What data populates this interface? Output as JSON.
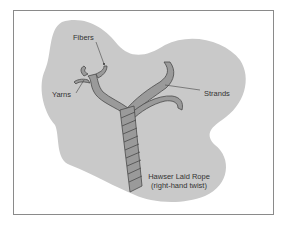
{
  "diagram": {
    "labels": {
      "fibers": "Fibers",
      "yarns": "Yarns",
      "strands": "Strands",
      "rope_line1": "Hawser Laid Rope",
      "rope_line2": "(right-hand twist)"
    },
    "colors": {
      "blob": "#c9c9c9",
      "strand_fill": "#9a9a9a",
      "strand_stroke": "#4a4a4a",
      "text": "#333333",
      "frame": "#8a8a8a"
    }
  }
}
